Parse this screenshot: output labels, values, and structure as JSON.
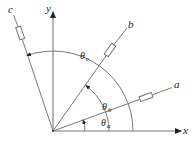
{
  "diagram": {
    "type": "vector-angle-diagram",
    "axes": {
      "x_label": "x",
      "y_label": "y"
    },
    "vectors": [
      {
        "id": "a",
        "label": "a",
        "angle_label_base": "θ",
        "angle_label_sub": "a",
        "angle_deg": 20
      },
      {
        "id": "b",
        "label": "b",
        "angle_label_base": "θ",
        "angle_label_sub": "b",
        "angle_deg": 54
      },
      {
        "id": "c",
        "label": "c",
        "angle_label_base": "θ",
        "angle_label_sub": "c",
        "angle_deg": 109
      }
    ],
    "colors": {
      "line": "#777777",
      "text": "#222222",
      "arrow": "#222222"
    }
  }
}
